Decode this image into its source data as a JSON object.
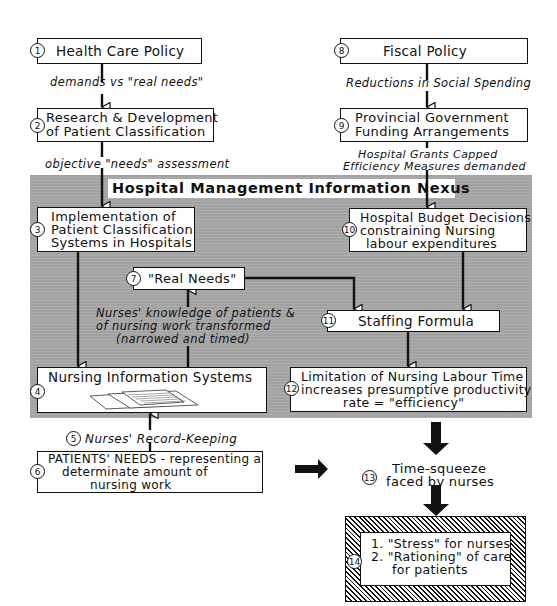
{
  "panel": {
    "title": "Hospital Management Information Nexus",
    "background": "#a9a9a9"
  },
  "nodes": {
    "n1": {
      "number": "1",
      "text": "Health Care Policy"
    },
    "n2": {
      "number": "2",
      "line1": "Research & Development",
      "line2": "of Patient Classification"
    },
    "n3": {
      "number": "3",
      "line1": "Implementation of",
      "line2": "Patient Classification",
      "line3": "Systems in Hospitals"
    },
    "n4": {
      "number": "4",
      "text": "Nursing Information Systems"
    },
    "n5": {
      "number": "5",
      "text": "Nurses' Record-Keeping"
    },
    "n6": {
      "number": "6",
      "line1": "PATIENTS' NEEDS - representing a",
      "line2": "determinate amount of",
      "line3": "nursing work"
    },
    "n7": {
      "number": "7",
      "text": "\"Real Needs\""
    },
    "n8": {
      "number": "8",
      "text": "Fiscal Policy"
    },
    "n9": {
      "number": "9",
      "line1": "Provincial Government",
      "line2": "Funding Arrangements"
    },
    "n10": {
      "number": "10",
      "line1": "Hospital Budget Decisions",
      "line2": "constraining Nursing",
      "line3": "labour expenditures"
    },
    "n11": {
      "number": "11",
      "text": "Staffing Formula"
    },
    "n12": {
      "number": "12",
      "line1": "Limitation of Nursing Labour Time",
      "line2": "increases presumptive productivity",
      "line3": "rate = \"efficiency\""
    },
    "n13": {
      "number": "13",
      "line1": "Time-squeeze",
      "line2": "faced by nurses"
    },
    "n14": {
      "number": "14",
      "line1": "1. \"Stress\" for nurses",
      "line2": "2. \"Rationing\" of care",
      "line3": "for patients"
    }
  },
  "edges": {
    "e1_2": {
      "label": "demands vs \"real needs\""
    },
    "e2_3": {
      "label": "objective \"needs\" assessment"
    },
    "e8_9": {
      "label": "Reductions in Social Spending"
    },
    "e9_10": {
      "line1": "Hospital Grants Capped",
      "line2": "Efficiency Measures demanded"
    },
    "e4_7": {
      "line1": "Nurses' knowledge of patients &",
      "line2": "of nursing work transformed",
      "line3": "(narrowed and timed)"
    }
  }
}
